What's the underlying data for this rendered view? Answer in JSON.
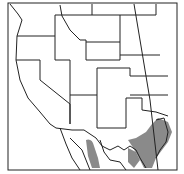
{
  "map": {
    "region": "Western North America",
    "range_color": "#8a8a8a",
    "line_color": "#222222"
  }
}
